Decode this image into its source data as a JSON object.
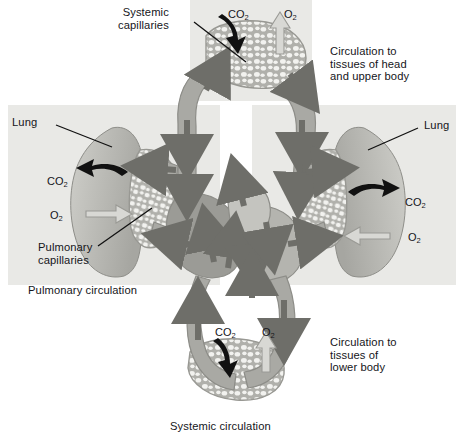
{
  "figure": {
    "title": "Systemic circulation",
    "domain_kind": "anatomical-diagram",
    "palette": {
      "background": "#ffffff",
      "panel_fill": "#e9e9e6",
      "vessel_fill": "#a9a9a4",
      "vessel_light": "#c4c4bf",
      "vessel_shadow": "#8d8d88",
      "lung_fill": "#bcbcb7",
      "lung_shadow": "#a3a39e",
      "capillary_fill": "#b0b0ab",
      "arrow_dark": "#6e6e69",
      "arrow_black": "#111111",
      "arrow_light": "#d8d8d4",
      "text": "#15151a",
      "leader_line": "#111111"
    }
  },
  "panels": [
    {
      "name": "systemic-capillaries-upper-panel",
      "x": 190,
      "y": 0,
      "w": 122,
      "h": 101
    },
    {
      "name": "left-lung-panel",
      "x": 8,
      "y": 105,
      "w": 212,
      "h": 180
    },
    {
      "name": "right-lung-panel",
      "x": 252,
      "y": 105,
      "w": 204,
      "h": 180
    }
  ],
  "labels": {
    "systemic_capillaries": "Systemic\ncapillaries",
    "circulation_head": "Circulation to\ntissues of head\nand upper body",
    "lung_left": "Lung",
    "lung_right": "Lung",
    "pulmonary_capillaries": "Pulmonary\ncapillaries",
    "pulmonary_circulation": "Pulmonary circulation",
    "circulation_lower": "Circulation to\ntissues of\nlower body",
    "systemic_circulation": "Systemic circulation"
  },
  "gas_labels": [
    {
      "name": "co2-top-systemic",
      "text": "CO",
      "sub": "2",
      "x": 228,
      "y": 8
    },
    {
      "name": "o2-top-systemic",
      "text": "O",
      "sub": "2",
      "x": 284,
      "y": 8
    },
    {
      "name": "co2-left-lung",
      "text": "CO",
      "sub": "2",
      "x": 47,
      "y": 175
    },
    {
      "name": "o2-left-lung",
      "text": "O",
      "sub": "2",
      "x": 50,
      "y": 209
    },
    {
      "name": "co2-right-lung",
      "text": "CO",
      "sub": "2",
      "x": 405,
      "y": 196
    },
    {
      "name": "o2-right-lung",
      "text": "O",
      "sub": "2",
      "x": 408,
      "y": 231
    },
    {
      "name": "co2-bottom-systemic",
      "text": "CO",
      "sub": "2",
      "x": 215,
      "y": 326
    },
    {
      "name": "o2-bottom-systemic",
      "text": "O",
      "sub": "2",
      "x": 262,
      "y": 326
    }
  ],
  "exchange_arrows": [
    {
      "name": "co2-in-arrow-top-systemic",
      "kind": "black",
      "meaning": "CO2 enters blood from tissue"
    },
    {
      "name": "o2-out-arrow-top-systemic",
      "kind": "light",
      "meaning": "O2 leaves blood to tissue"
    },
    {
      "name": "co2-out-arrow-left-lung",
      "kind": "black",
      "meaning": "CO2 leaves blood to lung"
    },
    {
      "name": "o2-in-arrow-left-lung",
      "kind": "light",
      "meaning": "O2 enters blood from lung"
    },
    {
      "name": "co2-out-arrow-right-lung",
      "kind": "black",
      "meaning": "CO2 leaves blood to lung"
    },
    {
      "name": "o2-in-arrow-right-lung",
      "kind": "light",
      "meaning": "O2 enters blood from lung"
    },
    {
      "name": "co2-in-arrow-bottom-systemic",
      "kind": "black",
      "meaning": "CO2 enters blood from tissue"
    },
    {
      "name": "o2-out-arrow-bottom-systemic",
      "kind": "light",
      "meaning": "O2 leaves blood to tissue"
    }
  ],
  "flow_arrow_count": 18
}
